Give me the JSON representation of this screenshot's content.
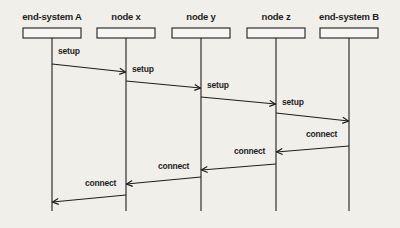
{
  "diagram": {
    "type": "sequence",
    "participants": [
      {
        "id": "A",
        "label": "end-system A",
        "x": 52
      },
      {
        "id": "x",
        "label": "node x",
        "x": 126
      },
      {
        "id": "y",
        "label": "node y",
        "x": 201
      },
      {
        "id": "z",
        "label": "node z",
        "x": 276
      },
      {
        "id": "B",
        "label": "end-system B",
        "x": 349
      }
    ],
    "messages": [
      {
        "label": "setup",
        "from": "A",
        "to": "x",
        "y1": 64,
        "y2": 72,
        "lx": 58,
        "ly": 46
      },
      {
        "label": "setup",
        "from": "x",
        "to": "y",
        "y1": 81,
        "y2": 88,
        "lx": 132,
        "ly": 64
      },
      {
        "label": "setup",
        "from": "y",
        "to": "z",
        "y1": 97,
        "y2": 104,
        "lx": 207,
        "ly": 80
      },
      {
        "label": "setup",
        "from": "z",
        "to": "B",
        "y1": 113,
        "y2": 121,
        "lx": 282,
        "ly": 97
      },
      {
        "label": "connect",
        "from": "B",
        "to": "z",
        "y1": 146,
        "y2": 152,
        "lx": 306,
        "ly": 129
      },
      {
        "label": "connect",
        "from": "z",
        "to": "y",
        "y1": 164,
        "y2": 170,
        "lx": 234,
        "ly": 146
      },
      {
        "label": "connect",
        "from": "y",
        "to": "x",
        "y1": 177,
        "y2": 184,
        "lx": 158,
        "ly": 161
      },
      {
        "label": "connect",
        "from": "x",
        "to": "A",
        "y1": 195,
        "y2": 202,
        "lx": 85,
        "ly": 178
      }
    ],
    "colors": {
      "background": "#f1efea",
      "line": "#1e1e1e"
    }
  }
}
